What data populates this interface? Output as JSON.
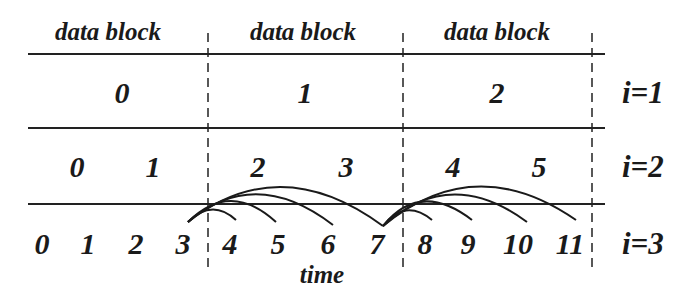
{
  "headers": [
    "data block",
    "data block",
    "data block"
  ],
  "rows": [
    {
      "level": "i=1",
      "items": [
        "0",
        "1",
        "2"
      ]
    },
    {
      "level": "i=2",
      "items": [
        "0",
        "1",
        "2",
        "3",
        "4",
        "5"
      ]
    },
    {
      "level": "i=3",
      "items": [
        "0",
        "1",
        "2",
        "3",
        "4",
        "5",
        "6",
        "7",
        "8",
        "9",
        "10",
        "11"
      ]
    }
  ],
  "axis_label": "time",
  "dependencies": [
    {
      "from": "3",
      "to": [
        "4",
        "5",
        "6",
        "7"
      ]
    },
    {
      "from": "7",
      "to": [
        "8",
        "9",
        "10",
        "11"
      ]
    }
  ]
}
